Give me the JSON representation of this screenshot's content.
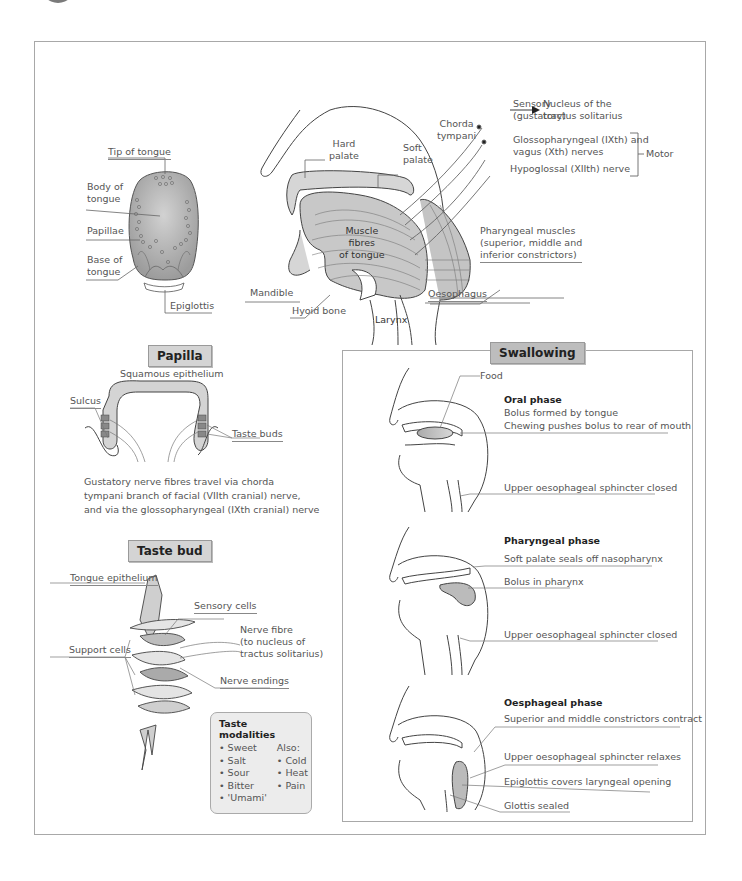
{
  "tongue": {
    "labels": {
      "tip": "Tip of tongue",
      "body": "Body of\ntongue",
      "papillae": "Papillae",
      "base": "Base of\ntongue",
      "epiglottis": "Epiglottis"
    }
  },
  "head_section": {
    "labels": {
      "hard_palate": "Hard\npalate",
      "soft_palate": "Soft\npalate",
      "chorda_tympani": "Chorda\ntympani",
      "muscle_fibres": "Muscle\nfibres\nof tongue",
      "mandible": "Mandible",
      "hyoid_bone": "Hyoid bone",
      "larynx": "Larynx",
      "oesophagus": "Oesophagus",
      "pharyngeal_muscles": "Pharyngeal muscles\n(superior, middle and\ninferior constrictors)"
    },
    "nerves": {
      "sensory": "Sensory\n(gustatory)",
      "arrow_target": "Nucleus of the\ntractus solitarius",
      "glossopharyngeal": "Glossopharyngeal (IXth) and\nvagus (Xth) nerves",
      "hypoglossal": "Hypoglossal (XIIth) nerve",
      "motor": "Motor"
    }
  },
  "papilla": {
    "title": "Papilla",
    "labels": {
      "squamous": "Squamous epithelium",
      "sulcus": "Sulcus",
      "taste_buds": "Taste buds"
    },
    "caption": "Gustatory nerve fibres travel via chorda\ntympani branch of facial (VIIth cranial) nerve,\nand via the glossopharyngeal (IXth cranial) nerve"
  },
  "taste_bud": {
    "title": "Taste bud",
    "labels": {
      "tongue_epithelium": "Tongue epithelium",
      "sensory_cells": "Sensory cells",
      "support_cells": "Support cells",
      "nerve_fibre": "Nerve fibre\n(to nucleus of\ntractus solitarius)",
      "nerve_endings": "Nerve endings"
    },
    "modalities": {
      "title": "Taste modalities",
      "primary": [
        "• Sweet",
        "• Salt",
        "• Sour",
        "• Bitter",
        "• 'Umami'"
      ],
      "also_label": "Also:",
      "also": [
        "• Cold",
        "• Heat",
        "• Pain"
      ]
    }
  },
  "swallowing": {
    "title": "Swallowing",
    "phases": [
      {
        "title": "Oral phase",
        "food_label": "Food",
        "lines": [
          "Bolus formed by tongue",
          "Chewing pushes bolus to rear of mouth"
        ],
        "bottom": "Upper oesophageal sphincter closed"
      },
      {
        "title": "Pharyngeal phase",
        "lines": [
          "Soft palate seals off nasopharynx",
          "Bolus in pharynx"
        ],
        "bottom": "Upper oesophageal sphincter closed"
      },
      {
        "title": "Oesphageal phase",
        "lines": [
          "Superior and middle constrictors contract",
          "Upper oesophageal sphincter relaxes",
          "Epiglottis covers laryngeal opening",
          "Glottis sealed"
        ]
      }
    ]
  },
  "colors": {
    "frame": "#a8a8a8",
    "badge_bg": "#d4d4d4",
    "tissue_fill": "#bdbdbd",
    "text": "#555555"
  }
}
